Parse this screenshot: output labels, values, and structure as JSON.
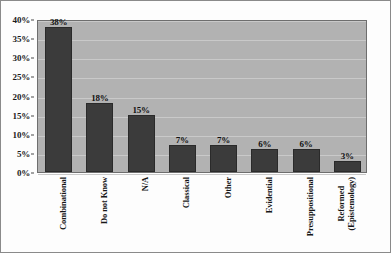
{
  "chart_data": {
    "type": "bar",
    "title": "",
    "subtitle": "",
    "xlabel": "",
    "ylabel": "",
    "categories": [
      "Combinational",
      "Do not Know",
      "N/A",
      "Classical",
      "Other",
      "Evidential",
      "Presuppositional",
      "Reformed (Epistemology)"
    ],
    "category_lines": [
      [
        "Combinational"
      ],
      [
        "Do not Know"
      ],
      [
        "N/A"
      ],
      [
        "Classical"
      ],
      [
        "Other"
      ],
      [
        "Evidential"
      ],
      [
        "Presuppositional"
      ],
      [
        "Reformed",
        "(Epistemology)"
      ]
    ],
    "values": [
      38,
      18,
      15,
      7,
      7,
      6,
      6,
      3
    ],
    "data_labels": [
      "38%",
      "18%",
      "15%",
      "7%",
      "7%",
      "6%",
      "6%",
      "3%"
    ],
    "ylim": [
      0,
      40
    ],
    "ytick_values": [
      0,
      5,
      10,
      15,
      20,
      25,
      30,
      35,
      40
    ],
    "ytick_labels": [
      "0%",
      "5%",
      "10%",
      "15%",
      "20%",
      "25%",
      "30%",
      "35%",
      "40%"
    ],
    "grid": true,
    "legend": "none",
    "bar_color": "#3b3b3b",
    "plot_background": "#b2b2b2",
    "gridline_color": "#c9c9c9",
    "axis_color": "#4a4a4a",
    "text_color": "#171717"
  }
}
